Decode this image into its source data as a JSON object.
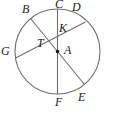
{
  "figure": {
    "type": "circle-geometry-diagram",
    "background_color": "#ffffff",
    "stroke_color": "#6e6e6e",
    "label_color": "#1a1a1a",
    "circle": {
      "name": "circle-A",
      "center_label": "A",
      "cx": 57.5,
      "cy": 51.5,
      "r": 42.5
    },
    "points": [
      {
        "id": "B",
        "label": "B",
        "x": 31.0,
        "y": 19.0,
        "label_x": 22,
        "label_y": 3
      },
      {
        "id": "C",
        "label": "C",
        "x": 57.5,
        "y": 9.0,
        "label_x": 55,
        "label_y": -2
      },
      {
        "id": "D",
        "label": "D",
        "x": 85.5,
        "y": 22.0,
        "label_x": 72,
        "label_y": 1
      },
      {
        "id": "G",
        "label": "G",
        "x": 15.5,
        "y": 58.0,
        "label_x": 1,
        "label_y": 45
      },
      {
        "id": "T",
        "label": "T",
        "x": 45.0,
        "y": 44.0,
        "label_x": 37,
        "label_y": 37
      },
      {
        "id": "K",
        "label": "K",
        "x": 57.5,
        "y": 33.0,
        "label_x": 59,
        "label_y": 22
      },
      {
        "id": "A",
        "label": "A",
        "x": 57.5,
        "y": 51.5,
        "label_x": 64,
        "label_y": 44
      },
      {
        "id": "F",
        "label": "F",
        "x": 57.5,
        "y": 94.0,
        "label_x": 55,
        "label_y": 96
      },
      {
        "id": "E",
        "label": "E",
        "x": 84.0,
        "y": 84.0,
        "label_x": 78,
        "label_y": 91
      }
    ],
    "segments": [
      {
        "name": "segment-CF",
        "from": "C",
        "to": "F",
        "kind": "diameter"
      },
      {
        "name": "segment-BE",
        "from": "B",
        "to": "E",
        "kind": "diameter"
      },
      {
        "name": "segment-GD",
        "from": "G",
        "to": "D",
        "kind": "chord"
      }
    ],
    "marked_center": {
      "name": "center-point-A",
      "x": 57.5,
      "y": 51.5,
      "radius": 1.8
    },
    "labels": {
      "B": "B",
      "C": "C",
      "D": "D",
      "G": "G",
      "T": "T",
      "K": "K",
      "A": "A",
      "F": "F",
      "E": "E"
    }
  }
}
